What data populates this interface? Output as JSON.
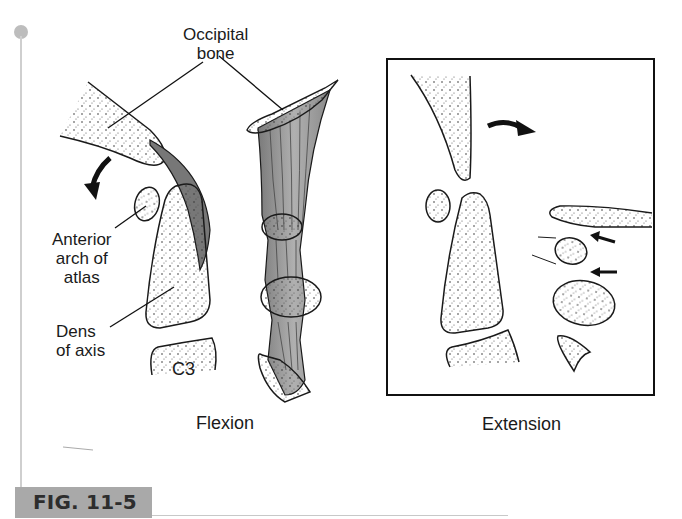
{
  "figure": {
    "id_label": "FIG. 11-5",
    "panels": [
      {
        "caption": "Flexion",
        "labels": {
          "occipital_line1": "Occipital",
          "occipital_line2": "bone",
          "anterior_line1": "Anterior",
          "anterior_line2": "arch of",
          "anterior_line3": "atlas",
          "dens_line1": "Dens",
          "dens_line2": "of axis",
          "c3": "C3"
        }
      },
      {
        "caption": "Extension"
      }
    ]
  },
  "colors": {
    "ink": "#1a1a1a",
    "ligament_dark": "#6e6e6e",
    "ligament_light": "#b8b8b8",
    "fig_label_bg": "#a9a9a9",
    "rail": "#c4c4c4"
  }
}
